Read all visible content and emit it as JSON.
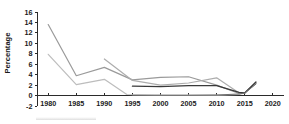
{
  "chart_data": {
    "type": "line",
    "title": "",
    "subtitle": "",
    "xlabel": "",
    "ylabel": "Percentage",
    "xlim": [
      1978,
      2022
    ],
    "ylim": [
      -2,
      16
    ],
    "xticks": [
      1980,
      1985,
      1990,
      1995,
      2000,
      2005,
      2010,
      2015,
      2020
    ],
    "yticks": [
      -2,
      0,
      2,
      4,
      6,
      8,
      10,
      12,
      14,
      16
    ],
    "xtick_labels": [
      "1980",
      "1985",
      "1990",
      "1995",
      "2000",
      "2005",
      "2010",
      "2015",
      "2020"
    ],
    "ytick_labels": [
      "-2",
      "0",
      "2",
      "4",
      "6",
      "8",
      "10",
      "12",
      "14",
      "16"
    ],
    "grid": false,
    "legend": "none",
    "series": [
      {
        "name": "series-1",
        "color": "#9a9a9a",
        "width": 1.2,
        "x": [
          1980,
          1985,
          1990,
          1995,
          2000,
          2005,
          2010,
          2014,
          2015,
          2017
        ],
        "values": [
          13.6,
          3.8,
          5.4,
          3.0,
          3.5,
          3.6,
          2.0,
          0.4,
          0.5,
          2.3
        ]
      },
      {
        "name": "series-2",
        "color": "#bdbdbd",
        "width": 1.2,
        "x": [
          1980,
          1985,
          1990,
          1994,
          1999,
          2005,
          2010,
          2014,
          2015,
          2017
        ],
        "values": [
          7.9,
          2.1,
          3.1,
          0.2,
          0.1,
          0.1,
          0.1,
          0.2,
          0.5,
          2.5
        ]
      },
      {
        "name": "series-3",
        "color": "#adadad",
        "width": 1.2,
        "x": [
          1990,
          1995,
          2000,
          2005,
          2010,
          2014,
          2015,
          2017
        ],
        "values": [
          7.0,
          2.9,
          2.0,
          2.4,
          3.4,
          0.5,
          0.5,
          2.4
        ]
      },
      {
        "name": "series-4",
        "color": "#3a3a3a",
        "width": 1.3,
        "x": [
          1995,
          2000,
          2005,
          2010,
          2014,
          2015,
          2017
        ],
        "values": [
          1.8,
          1.7,
          1.9,
          1.9,
          0.6,
          0.5,
          2.6
        ]
      },
      {
        "name": "series-5",
        "color": "#6e6e6e",
        "width": 1.0,
        "x": [
          1995,
          2000,
          2005,
          2010,
          2014,
          2015,
          2017
        ],
        "values": [
          0.05,
          0.05,
          0.05,
          0.1,
          0.3,
          0.5,
          2.2
        ]
      }
    ]
  }
}
